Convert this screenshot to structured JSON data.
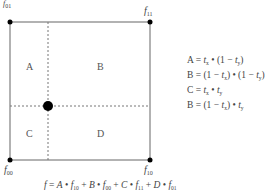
{
  "corners": {
    "top_left": {
      "name": "f",
      "sub": "01"
    },
    "top_right": {
      "name": "f",
      "sub": "11"
    },
    "bottom_left": {
      "name": "f",
      "sub": "00"
    },
    "bottom_right": {
      "name": "f",
      "sub": "10"
    }
  },
  "regions": {
    "a": "A",
    "b": "B",
    "c": "C",
    "d": "D"
  },
  "equations": [
    {
      "lhs": "A",
      "rhs_parts": [
        "t",
        "x",
        " • (1 − ",
        "t",
        "y",
        ")"
      ]
    },
    {
      "lhs": "B",
      "rhs_parts": [
        "(1 − ",
        "t",
        "x",
        ") • (1 − ",
        "t",
        "y",
        ")"
      ]
    },
    {
      "lhs": "C",
      "rhs_parts": [
        "t",
        "x",
        " • ",
        "t",
        "y",
        ""
      ]
    },
    {
      "lhs": "B",
      "rhs_parts": [
        "(1 − ",
        "t",
        "x",
        ") • ",
        "t",
        "y",
        ""
      ]
    }
  ],
  "formula": {
    "lhs": "f",
    "terms": [
      {
        "w": "A",
        "f": "f",
        "sub": "10"
      },
      {
        "w": "B",
        "f": "f",
        "sub": "00"
      },
      {
        "w": "C",
        "f": "f",
        "sub": "11"
      },
      {
        "w": "D",
        "f": "f",
        "sub": "01"
      }
    ]
  },
  "colors": {
    "line": "#555555",
    "dash": "#777777",
    "dot": "#000000"
  }
}
